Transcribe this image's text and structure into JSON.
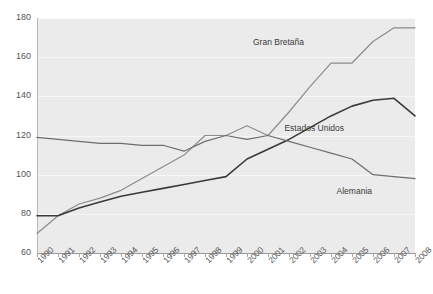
{
  "chart_data": {
    "type": "line",
    "title": "",
    "subtitle": "",
    "xlabel": "",
    "ylabel": "",
    "xlim": [
      1990,
      2008
    ],
    "ylim": [
      60,
      180
    ],
    "ytick_step": 20,
    "grid": true,
    "legend_position": "inline-annotations",
    "x": [
      1990,
      1991,
      1992,
      1993,
      1994,
      1995,
      1996,
      1997,
      1998,
      1999,
      2000,
      2001,
      2002,
      2003,
      2004,
      2005,
      2006,
      2007,
      2008
    ],
    "yticks": [
      60,
      80,
      100,
      120,
      140,
      160,
      180
    ],
    "xticks": [
      "1990",
      "1991",
      "1992",
      "1993",
      "1994",
      "1995",
      "1996",
      "1997",
      "1998",
      "1999",
      "2000",
      "2001",
      "2002",
      "2003",
      "2004",
      "2005",
      "2006",
      "2007",
      "2008"
    ],
    "series": [
      {
        "name": "Gran Bretaña",
        "color": "#8c8c8c",
        "values": [
          70,
          79,
          85,
          88,
          92,
          98,
          104,
          110,
          120,
          120,
          125,
          120,
          132,
          145,
          157,
          157,
          168,
          175,
          175
        ]
      },
      {
        "name": "Estados Unidos",
        "color": "#3a3a3a",
        "values": [
          79,
          79,
          83,
          86,
          89,
          91,
          93,
          95,
          97,
          99,
          108,
          113,
          118,
          124,
          130,
          135,
          138,
          139,
          130
        ]
      },
      {
        "name": "Alemania",
        "color": "#6e6e6e",
        "values": [
          119,
          118,
          117,
          116,
          116,
          115,
          115,
          112,
          117,
          120,
          118,
          120,
          117,
          114,
          111,
          108,
          100,
          99,
          98
        ]
      }
    ],
    "annotations": [
      {
        "text": "Gran Bretaña",
        "series": "Gran Bretaña"
      },
      {
        "text": "Estados Unidos",
        "series": "Estados Unidos"
      },
      {
        "text": "Alemania",
        "series": "Alemania"
      }
    ]
  },
  "labels": {
    "gran_bretana": "Gran Bretaña",
    "estados_unidos": "Estados Unidos",
    "alemania": "Alemania"
  },
  "colors": {
    "plot_background": "#ebebeb",
    "gridline": "#f7f7f7",
    "axis": "#9a9a9a",
    "tick_text": "#555555",
    "gran_bretana": "#8c8c8c",
    "estados_unidos": "#3a3a3a",
    "alemania": "#6e6e6e"
  }
}
